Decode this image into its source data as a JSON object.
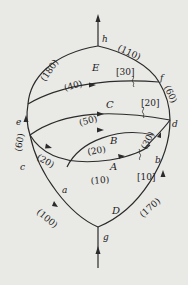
{
  "diagram": {
    "type": "flow-network",
    "background": "#e9e9e6",
    "line_color": "#2b2b2b",
    "nodes": [
      {
        "id": "h",
        "label": "h"
      },
      {
        "id": "f",
        "label": "f"
      },
      {
        "id": "e",
        "label": "e"
      },
      {
        "id": "d",
        "label": "d"
      },
      {
        "id": "c",
        "label": "c"
      },
      {
        "id": "b",
        "label": "b"
      },
      {
        "id": "a",
        "label": "a"
      },
      {
        "id": "g",
        "label": "g"
      }
    ],
    "regions": [
      {
        "id": "E",
        "label": "E"
      },
      {
        "id": "C",
        "label": "C"
      },
      {
        "id": "B",
        "label": "B"
      },
      {
        "id": "A",
        "label": "A"
      },
      {
        "id": "D",
        "label": "D"
      }
    ],
    "edges": [
      {
        "from": "e",
        "to": "h",
        "label": "(180)"
      },
      {
        "from": "f",
        "to": "h",
        "label": "(110)"
      },
      {
        "from": "d",
        "to": "f",
        "label": "(60)"
      },
      {
        "from": "e",
        "to": "f",
        "label": "(40)"
      },
      {
        "from": "c",
        "to": "d",
        "label": "(50)"
      },
      {
        "from": "c",
        "to": "e",
        "label": "(60)"
      },
      {
        "from": "c",
        "to": "a",
        "label": "(20)"
      },
      {
        "from": "a",
        "to": "b",
        "label": "(20)"
      },
      {
        "from": "a",
        "to": "b",
        "label": "(10)"
      },
      {
        "from": "b",
        "to": "d",
        "label": "(30)"
      },
      {
        "from": "g",
        "to": "c",
        "label": "(100)"
      },
      {
        "from": "g",
        "to": "d",
        "label": "(170)"
      }
    ],
    "bracket_labels": [
      {
        "near": "f",
        "label": "[30]"
      },
      {
        "near": "d",
        "label": "[20]"
      },
      {
        "near": "b",
        "label": "[10]"
      }
    ]
  }
}
